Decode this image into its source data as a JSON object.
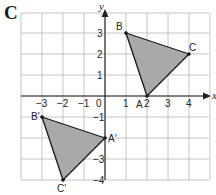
{
  "panel_label": "C",
  "axes": {
    "x_label": "x",
    "y_label": "y",
    "x_range": [
      -4,
      5
    ],
    "y_range": [
      -4,
      4
    ],
    "x_ticks": [
      {
        "value": -3,
        "label": "−3"
      },
      {
        "value": -2,
        "label": "−2"
      },
      {
        "value": -1,
        "label": "−1"
      },
      {
        "value": 1,
        "label": "1"
      },
      {
        "value": 2,
        "label": "2"
      },
      {
        "value": 3,
        "label": "3"
      },
      {
        "value": 4,
        "label": "4"
      }
    ],
    "origin_label": "0",
    "y_ticks": [
      {
        "value": 3,
        "label": "3"
      },
      {
        "value": 2,
        "label": "2"
      },
      {
        "value": 1,
        "label": "1"
      },
      {
        "value": -1,
        "label": "−1"
      },
      {
        "value": -3,
        "label": "−3"
      },
      {
        "value": -4,
        "label": "−4"
      }
    ]
  },
  "triangles": [
    {
      "name": "ABC",
      "color": "#a9a9a9",
      "vertices": [
        {
          "label": "A",
          "x": 2,
          "y": 0
        },
        {
          "label": "B",
          "x": 1,
          "y": 3
        },
        {
          "label": "C",
          "x": 4,
          "y": 2
        }
      ]
    },
    {
      "name": "A'B'C'",
      "color": "#a9a9a9",
      "vertices": [
        {
          "label": "A′",
          "x": 0,
          "y": -2
        },
        {
          "label": "B′",
          "x": -3,
          "y": -1
        },
        {
          "label": "C′",
          "x": -2,
          "y": -4
        }
      ]
    }
  ]
}
